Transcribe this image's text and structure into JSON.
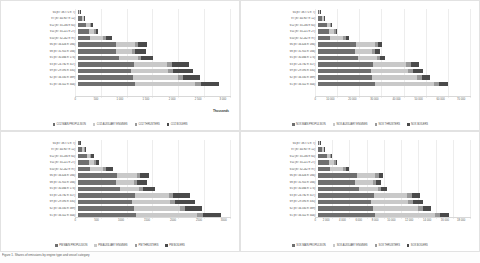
{
  "figure": {
    "caption": "Figure 1. Shares of emissions by engine type and vessel category"
  },
  "palette": {
    "main_propulsion": "#6f6f6f",
    "auxiliary_engines": "#c9c9c9",
    "thrusters": "#9a9a9a",
    "boilers": "#4a4a4a",
    "gridline": "#ededed",
    "axis": "#d8d8d8"
  },
  "categories": [
    "V4 (8T: 38.771 n: 7)",
    "V7 (8T: 44.907 n: 12)",
    "V12 (8T: 35.236 n: 65)",
    "V11 (8T: 35.221 n: 27)",
    "V10 (8T: 32.242 n: 97)",
    "V6 (8T: 34.426 n: 184)",
    "V8 (8T: 31.925 n: 166)",
    "V5 (8T: 30.466 n: 173)",
    "V3 (8T: 24.782 n: 317)",
    "V9 (8T: 29.395 n: 335)",
    "V2 (8T: 34.335 n: 389)",
    "V1 (8T: 34.322 n: 344)"
  ],
  "chart_data": [
    {
      "id": "co2",
      "type": "bar",
      "orientation": "horizontal",
      "stacked": true,
      "title": "",
      "xlabel": "",
      "ylabel": "",
      "units_label": "Thousands",
      "xlim": [
        0,
        3000
      ],
      "xticks": [
        "0",
        "500",
        "1 000",
        "1 500",
        "2 000",
        "2 500",
        "3 000"
      ],
      "grid": true,
      "legend_position": "bottom",
      "categories": [
        "V4 (8T: 38.771 n: 7)",
        "V7 (8T: 44.907 n: 12)",
        "V12 (8T: 35.236 n: 65)",
        "V11 (8T: 35.221 n: 27)",
        "V10 (8T: 32.242 n: 97)",
        "V6 (8T: 34.426 n: 184)",
        "V8 (8T: 31.925 n: 166)",
        "V5 (8T: 30.466 n: 173)",
        "V3 (8T: 24.782 n: 317)",
        "V9 (8T: 29.395 n: 335)",
        "V2 (8T: 34.335 n: 389)",
        "V1 (8T: 34.322 n: 344)"
      ],
      "series": [
        {
          "name": "CO2 MAIN PROPULSION",
          "color": "#6f6f6f",
          "values": [
            38,
            92,
            175,
            215,
            245,
            760,
            745,
            820,
            1100,
            1050,
            1080,
            1120
          ]
        },
        {
          "name": "CO2 AUXILIARY ENGINES",
          "color": "#c9c9c9",
          "values": [
            10,
            30,
            60,
            110,
            250,
            370,
            330,
            360,
            650,
            720,
            880,
            1180
          ]
        },
        {
          "name": "CO2 THRUSTERS",
          "color": "#9a9a9a",
          "values": [
            4,
            10,
            25,
            30,
            55,
            60,
            55,
            60,
            90,
            95,
            100,
            110
          ]
        },
        {
          "name": "CO2 BOILERS",
          "color": "#4a4a4a",
          "values": [
            6,
            18,
            45,
            55,
            130,
            170,
            200,
            230,
            330,
            400,
            330,
            350
          ]
        }
      ]
    },
    {
      "id": "nox",
      "type": "bar",
      "orientation": "horizontal",
      "stacked": true,
      "title": "",
      "xlabel": "",
      "ylabel": "",
      "units_label": "",
      "xlim": [
        0,
        70000
      ],
      "xticks": [
        "0",
        "10 000",
        "20 000",
        "30 000",
        "40 000",
        "50 000",
        "60 000",
        "70 000"
      ],
      "grid": true,
      "legend_position": "bottom",
      "categories": [
        "V4 (8T: 38.771 n: 7)",
        "V7 (8T: 44.907 n: 12)",
        "V12 (8T: 35.236 n: 65)",
        "V11 (8T: 35.221 n: 27)",
        "V10 (8T: 32.242 n: 97)",
        "V6 (8T: 34.426 n: 184)",
        "V8 (8T: 31.925 n: 166)",
        "V5 (8T: 30.466 n: 173)",
        "V3 (8T: 24.782 n: 317)",
        "V9 (8T: 29.395 n: 335)",
        "V2 (8T: 34.335 n: 389)",
        "V1 (8T: 34.322 n: 344)"
      ],
      "series": [
        {
          "name": "NOX MAIN PROPULSION",
          "color": "#6f6f6f",
          "values": [
            900,
            2100,
            4200,
            5100,
            5800,
            17500,
            17000,
            18500,
            25500,
            24500,
            25000,
            26000
          ]
        },
        {
          "name": "NOX AUXILIARY ENGINES",
          "color": "#c9c9c9",
          "values": [
            250,
            700,
            1500,
            2600,
            6000,
            8500,
            8000,
            8500,
            15000,
            17000,
            20500,
            27000
          ]
        },
        {
          "name": "NOX THRUSTERS",
          "color": "#9a9a9a",
          "values": [
            90,
            250,
            600,
            700,
            1300,
            1400,
            1300,
            1400,
            2100,
            2200,
            2300,
            2600
          ]
        },
        {
          "name": "NOX BOILERS",
          "color": "#4a4a4a",
          "values": [
            60,
            200,
            500,
            600,
            1400,
            1900,
            2200,
            2500,
            3600,
            4400,
            3600,
            3800
          ]
        }
      ]
    },
    {
      "id": "pm",
      "type": "bar",
      "orientation": "horizontal",
      "stacked": true,
      "title": "",
      "xlabel": "",
      "ylabel": "",
      "units_label": "",
      "xlim": [
        0,
        3000
      ],
      "xticks": [
        "0",
        "500",
        "1000",
        "1500",
        "2000",
        "2500",
        "3000"
      ],
      "grid": true,
      "legend_position": "bottom",
      "categories": [
        "V4 (8T: 38.771 n: 7)",
        "V7 (8T: 44.907 n: 12)",
        "V12 (8T: 35.236 n: 65)",
        "V11 (8T: 35.221 n: 27)",
        "V10 (8T: 32.242 n: 97)",
        "V6 (8T: 34.426 n: 184)",
        "V8 (8T: 31.925 n: 166)",
        "V5 (8T: 30.466 n: 173)",
        "V3 (8T: 24.782 n: 317)",
        "V9 (8T: 29.395 n: 335)",
        "V2 (8T: 34.335 n: 389)",
        "V1 (8T: 34.322 n: 344)"
      ],
      "series": [
        {
          "name": "PM MAIN PROPULSION",
          "color": "#6f6f6f",
          "values": [
            40,
            95,
            180,
            220,
            250,
            780,
            760,
            840,
            1120,
            1070,
            1100,
            1140
          ]
        },
        {
          "name": "PM AUXILIARY ENGINES",
          "color": "#c9c9c9",
          "values": [
            11,
            32,
            62,
            112,
            255,
            380,
            340,
            370,
            660,
            730,
            900,
            1200
          ]
        },
        {
          "name": "PM THRUSTERS",
          "color": "#9a9a9a",
          "values": [
            4,
            11,
            26,
            31,
            56,
            62,
            56,
            62,
            92,
            97,
            102,
            112
          ]
        },
        {
          "name": "PM BOILERS",
          "color": "#4a4a4a",
          "values": [
            6,
            19,
            46,
            56,
            132,
            175,
            205,
            235,
            335,
            405,
            335,
            355
          ]
        }
      ]
    },
    {
      "id": "sox",
      "type": "bar",
      "orientation": "horizontal",
      "stacked": true,
      "title": "",
      "xlabel": "",
      "ylabel": "",
      "units_label": "",
      "xlim": [
        0,
        18000
      ],
      "xticks": [
        "0",
        "2 000",
        "4 000",
        "6 000",
        "8 000",
        "10 000",
        "12 000",
        "14 000",
        "16 000",
        "18 000"
      ],
      "grid": true,
      "legend_position": "bottom",
      "categories": [
        "V4 (8T: 38.771 n: 7)",
        "V7 (8T: 44.907 n: 12)",
        "V12 (8T: 35.236 n: 65)",
        "V11 (8T: 35.221 n: 27)",
        "V10 (8T: 32.242 n: 97)",
        "V6 (8T: 34.426 n: 184)",
        "V8 (8T: 31.925 n: 166)",
        "V5 (8T: 30.466 n: 173)",
        "V3 (8T: 24.782 n: 317)",
        "V9 (8T: 29.395 n: 335)",
        "V2 (8T: 34.335 n: 389)",
        "V1 (8T: 34.322 n: 344)"
      ],
      "series": [
        {
          "name": "SOX MAIN PROPULSION",
          "color": "#6f6f6f",
          "values": [
            230,
            560,
            1080,
            1320,
            1500,
            4600,
            4450,
            4900,
            6600,
            6300,
            6500,
            6750
          ]
        },
        {
          "name": "SOX AUXILIARY ENGINES",
          "color": "#c9c9c9",
          "values": [
            65,
            185,
            380,
            670,
            1550,
            2200,
            2050,
            2200,
            3900,
            4350,
            5300,
            7000
          ]
        },
        {
          "name": "SOX THRUSTERS",
          "color": "#9a9a9a",
          "values": [
            22,
            62,
            150,
            180,
            330,
            360,
            330,
            360,
            540,
            570,
            600,
            660
          ]
        },
        {
          "name": "SOX BOILERS",
          "color": "#4a4a4a",
          "values": [
            15,
            50,
            130,
            155,
            360,
            490,
            570,
            640,
            930,
            1130,
            930,
            980
          ]
        }
      ]
    }
  ]
}
